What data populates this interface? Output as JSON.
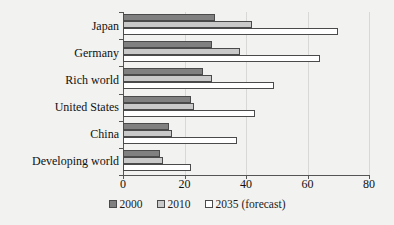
{
  "chart_data": {
    "type": "bar",
    "orientation": "horizontal",
    "title": "",
    "xlabel": "",
    "ylabel": "",
    "xlim": [
      0,
      80
    ],
    "xticks": [
      0,
      20,
      40,
      60,
      80
    ],
    "grid": true,
    "grid_axis": "x",
    "legend_position": "bottom",
    "categories": [
      "Japan",
      "Germany",
      "Rich world",
      "United States",
      "China",
      "Developing world"
    ],
    "series": [
      {
        "name": "2000",
        "color": "#808080",
        "values": [
          30,
          29,
          26,
          22,
          15,
          12
        ]
      },
      {
        "name": "2010",
        "color": "#c9c9c9",
        "values": [
          42,
          38,
          29,
          23,
          16,
          13
        ]
      },
      {
        "name": "2035 (forecast)",
        "color": "#ffffff",
        "values": [
          70,
          64,
          49,
          43,
          37,
          22
        ]
      }
    ]
  },
  "legend": {
    "items": [
      {
        "label": "2000"
      },
      {
        "label": "2010"
      },
      {
        "label": "2035 (forecast)"
      }
    ]
  },
  "colors": {
    "background": "#f2f2f0",
    "axis": "#555555",
    "gridline": "#d8d8d6",
    "bar_outline": "#4a4a4a",
    "text": "#111111"
  }
}
